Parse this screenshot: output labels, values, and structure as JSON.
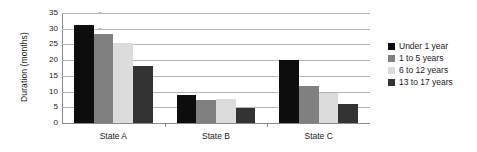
{
  "chart_data": {
    "type": "bar",
    "title": "",
    "subtitle": "",
    "xlabel": "",
    "ylabel": "Duration (months)",
    "categories": [
      "State A",
      "State B",
      "State C"
    ],
    "series": [
      {
        "name": "Under 1 year",
        "color": "#0d0d0d",
        "values": [
          31.3,
          9.0,
          20.2
        ]
      },
      {
        "name": "1 to 5 years",
        "color": "#808080",
        "values": [
          28.2,
          7.3,
          11.8
        ]
      },
      {
        "name": "6 to 12 years",
        "color": "#dcdcdc",
        "values": [
          25.5,
          7.6,
          9.5
        ]
      },
      {
        "name": "13 to 17 years",
        "color": "#333333",
        "values": [
          18.3,
          4.8,
          6.0
        ]
      }
    ],
    "ylim": [
      0,
      35
    ],
    "yticks": [
      0,
      5,
      10,
      15,
      20,
      25,
      30,
      35
    ],
    "ytick_labels": [
      "0",
      "5",
      "10",
      "15",
      "20",
      "25",
      "30",
      "35"
    ],
    "grid": "horizontal",
    "legend_position": "right",
    "background_color": "#ffffff",
    "grid_color": "#b5b5b5",
    "axis_color": "#8a8a8a"
  }
}
